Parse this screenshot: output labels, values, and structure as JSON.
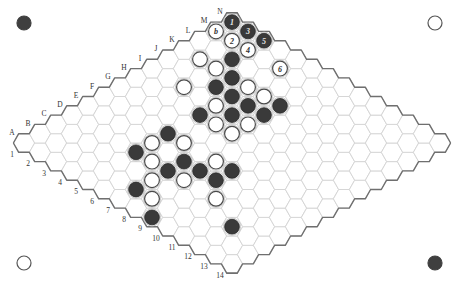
{
  "board": {
    "size": 14,
    "letters": [
      "A",
      "B",
      "C",
      "D",
      "E",
      "F",
      "G",
      "H",
      "I",
      "J",
      "K",
      "L",
      "M",
      "N"
    ],
    "numbers": [
      "1",
      "2",
      "3",
      "4",
      "5",
      "6",
      "7",
      "8",
      "9",
      "10",
      "11",
      "12",
      "13",
      "14"
    ],
    "colors": {
      "black": "#3a3a3a",
      "white": "#ffffff",
      "grid": "#d4d4d4",
      "edge": "#6f6f6f"
    },
    "corner_markers": [
      {
        "position": "top-left",
        "color": "black"
      },
      {
        "position": "top-right",
        "color": "white"
      },
      {
        "position": "bottom-left",
        "color": "white"
      },
      {
        "position": "bottom-right",
        "color": "black"
      }
    ],
    "stones": [
      {
        "cell": "N1",
        "color": "black",
        "label": "1"
      },
      {
        "cell": "M1",
        "color": "white",
        "label": "b"
      },
      {
        "cell": "N2",
        "color": "black",
        "label": "3"
      },
      {
        "cell": "M2",
        "color": "white",
        "label": "2"
      },
      {
        "cell": "N3",
        "color": "black",
        "label": "5"
      },
      {
        "cell": "M3",
        "color": "white",
        "label": "4"
      },
      {
        "cell": "M5",
        "color": "white",
        "label": "6"
      },
      {
        "cell": "K2",
        "color": "white",
        "label": ""
      },
      {
        "cell": "L3",
        "color": "black",
        "label": ""
      },
      {
        "cell": "K3",
        "color": "white",
        "label": ""
      },
      {
        "cell": "K4",
        "color": "black",
        "label": ""
      },
      {
        "cell": "I3",
        "color": "white",
        "label": ""
      },
      {
        "cell": "J4",
        "color": "black",
        "label": ""
      },
      {
        "cell": "K5",
        "color": "white",
        "label": ""
      },
      {
        "cell": "J5",
        "color": "black",
        "label": ""
      },
      {
        "cell": "K6",
        "color": "white",
        "label": ""
      },
      {
        "cell": "I5",
        "color": "white",
        "label": ""
      },
      {
        "cell": "J6",
        "color": "black",
        "label": ""
      },
      {
        "cell": "K7",
        "color": "black",
        "label": ""
      },
      {
        "cell": "H5",
        "color": "black",
        "label": ""
      },
      {
        "cell": "I6",
        "color": "black",
        "label": ""
      },
      {
        "cell": "J7",
        "color": "black",
        "label": ""
      },
      {
        "cell": "H6",
        "color": "white",
        "label": ""
      },
      {
        "cell": "I7",
        "color": "white",
        "label": ""
      },
      {
        "cell": "H7",
        "color": "white",
        "label": ""
      },
      {
        "cell": "F5",
        "color": "black",
        "label": ""
      },
      {
        "cell": "E5",
        "color": "white",
        "label": ""
      },
      {
        "cell": "F6",
        "color": "white",
        "label": ""
      },
      {
        "cell": "D5",
        "color": "black",
        "label": ""
      },
      {
        "cell": "D6",
        "color": "white",
        "label": ""
      },
      {
        "cell": "E7",
        "color": "black",
        "label": ""
      },
      {
        "cell": "D7",
        "color": "black",
        "label": ""
      },
      {
        "cell": "D8",
        "color": "white",
        "label": ""
      },
      {
        "cell": "C7",
        "color": "white",
        "label": ""
      },
      {
        "cell": "B7",
        "color": "black",
        "label": ""
      },
      {
        "cell": "B8",
        "color": "white",
        "label": ""
      },
      {
        "cell": "A9",
        "color": "black",
        "label": ""
      },
      {
        "cell": "F8",
        "color": "white",
        "label": ""
      },
      {
        "cell": "E8",
        "color": "black",
        "label": ""
      },
      {
        "cell": "F9",
        "color": "black",
        "label": ""
      },
      {
        "cell": "E9",
        "color": "black",
        "label": ""
      },
      {
        "cell": "D10",
        "color": "white",
        "label": ""
      },
      {
        "cell": "C12",
        "color": "black",
        "label": ""
      }
    ]
  }
}
